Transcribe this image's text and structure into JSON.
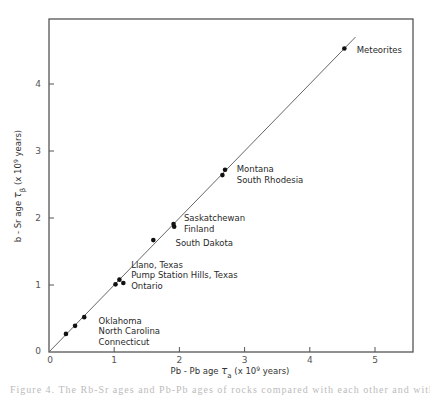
{
  "chart_data": {
    "type": "scatter",
    "title": "",
    "xlabel": "Pb - Pb  age  τa  (x 10⁹ years)",
    "ylabel": "b - Sr  age  τβ  (x 10⁹ years)",
    "xlim": [
      0,
      5.6
    ],
    "ylim": [
      0,
      4.95
    ],
    "xticks": [
      0,
      1,
      2,
      3,
      4,
      5
    ],
    "yticks": [
      0,
      1,
      2,
      3,
      4
    ],
    "grid": false,
    "legend": "none",
    "reference_line": {
      "type": "y=x",
      "from": [
        0,
        0
      ],
      "to": [
        4.7,
        4.7
      ]
    },
    "series": [
      {
        "name": "Rock ages",
        "points": [
          {
            "x": 0.26,
            "y": 0.27
          },
          {
            "x": 0.4,
            "y": 0.39
          },
          {
            "x": 0.54,
            "y": 0.52
          },
          {
            "x": 1.02,
            "y": 1.01
          },
          {
            "x": 1.08,
            "y": 1.08
          },
          {
            "x": 1.14,
            "y": 1.03
          },
          {
            "x": 1.6,
            "y": 1.67
          },
          {
            "x": 1.91,
            "y": 1.91
          },
          {
            "x": 1.92,
            "y": 1.87
          },
          {
            "x": 2.66,
            "y": 2.64
          },
          {
            "x": 2.7,
            "y": 2.72
          },
          {
            "x": 4.53,
            "y": 4.53
          }
        ]
      }
    ],
    "annotations": [
      {
        "lines": [
          "Meteorites"
        ],
        "x": 4.72,
        "y": 4.47
      },
      {
        "lines": [
          "Montana",
          "South Rhodesia"
        ],
        "x": 2.88,
        "y": 2.68
      },
      {
        "lines": [
          "Saskatchewan",
          "Finland"
        ],
        "x": 2.07,
        "y": 1.95
      },
      {
        "lines": [
          "South Dakota"
        ],
        "x": 1.94,
        "y": 1.58
      },
      {
        "lines": [
          "Llano, Texas",
          "Pump Station Hills, Texas",
          "Ontario"
        ],
        "x": 1.26,
        "y": 1.26
      },
      {
        "lines": [
          "Oklahoma",
          "North Carolina",
          "Connecticut"
        ],
        "x": 0.76,
        "y": 0.42
      }
    ]
  },
  "axes": {
    "x_title_parts": {
      "pre": "Pb - Pb  age  ",
      "sym": "τ",
      "sub": "a",
      "post": "  (x 10",
      "exp": "9",
      "tail": " years)"
    },
    "y_title_parts": {
      "pre": "b - Sr  age  ",
      "sym": "τ",
      "sub": "β",
      "post": "  (x 10",
      "exp": "9",
      "tail": " years)"
    },
    "x_tick_labels": [
      "0",
      "1",
      "2",
      "3",
      "4",
      "5"
    ],
    "y_tick_labels": [
      "0",
      "1",
      "2",
      "3",
      "4"
    ]
  },
  "caption": "Figure 4. The Rb-Sr ages and Pb-Pb ages of rocks compared with each other and with meteorites"
}
